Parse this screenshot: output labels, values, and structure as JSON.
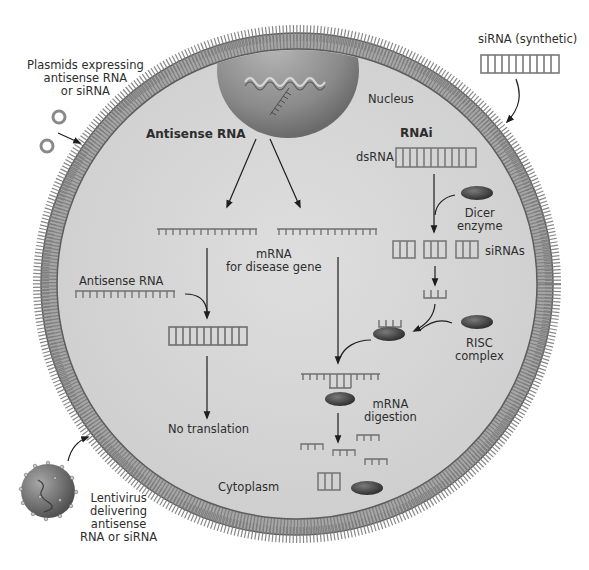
{
  "diagram": {
    "cell": {
      "nucleus_label": "Nucleus",
      "cytoplasm_label": "Cytoplasm",
      "colors": {
        "membrane": "#8e8e8e",
        "membrane_dark": "#5a5a5a",
        "cytoplasm": "#d6d6d6",
        "nucleus": "#9a9a9a",
        "rna": "#6f6f6f",
        "protein": "#4a4a4a"
      }
    },
    "external": {
      "plasmids_label": "Plasmids expressing\nantisense RNA\nor siRNA",
      "sirna_synthetic_label": "siRNA (synthetic)",
      "lentivirus_label": "Lentivirus\ndelivering\nantisense\nRNA or siRNA"
    },
    "antisense_pathway": {
      "heading": "Antisense RNA",
      "antisense_rna_label": "Antisense RNA",
      "mrna_label": "mRNA\nfor disease gene",
      "result_label": "No translation"
    },
    "rnai_pathway": {
      "heading": "RNAi",
      "dsrna_label": "dsRNA",
      "dicer_label": "Dicer\nenzyme",
      "sirnas_label": "siRNAs",
      "risc_label": "RISC\ncomplex",
      "digestion_label": "mRNA\ndigestion"
    }
  }
}
